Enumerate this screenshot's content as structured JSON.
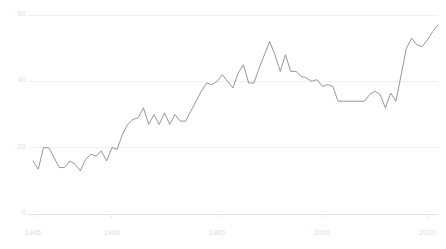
{
  "chart_data": {
    "type": "line",
    "title": "",
    "subtitle": "",
    "xlabel": "",
    "ylabel": "",
    "grid": true,
    "legend": false,
    "legend_position": "none",
    "xlim": [
      1945,
      2022
    ],
    "ylim": [
      0,
      60
    ],
    "x_ticks": [
      1945,
      1960,
      1980,
      2000,
      2020
    ],
    "x_tick_labels": [
      "1945",
      "1960",
      "1980",
      "2000",
      "2020"
    ],
    "y_ticks": [
      0,
      20,
      40,
      60
    ],
    "y_tick_labels": [
      "0",
      "20",
      "40",
      "60"
    ],
    "series": [
      {
        "name": "series-1",
        "color": "#8a8a8a",
        "x": [
          1945,
          1946,
          1947,
          1948,
          1949,
          1950,
          1951,
          1952,
          1953,
          1954,
          1955,
          1956,
          1957,
          1958,
          1959,
          1960,
          1961,
          1962,
          1963,
          1964,
          1965,
          1966,
          1967,
          1968,
          1969,
          1970,
          1971,
          1972,
          1973,
          1974,
          1975,
          1976,
          1977,
          1978,
          1979,
          1980,
          1981,
          1982,
          1983,
          1984,
          1985,
          1986,
          1987,
          1988,
          1989,
          1990,
          1991,
          1992,
          1993,
          1994,
          1995,
          1996,
          1997,
          1998,
          1999,
          2000,
          2001,
          2002,
          2003,
          2004,
          2005,
          2006,
          2007,
          2008,
          2009,
          2010,
          2011,
          2012,
          2013,
          2014,
          2015,
          2016,
          2017,
          2018,
          2019,
          2020,
          2021,
          2022
        ],
        "values": [
          16.0,
          13.5,
          20.0,
          20.0,
          17.0,
          14.0,
          14.0,
          16.0,
          15.0,
          13.0,
          16.5,
          18.0,
          17.5,
          19.0,
          16.0,
          20.0,
          19.5,
          24.0,
          27.0,
          28.5,
          29.0,
          32.0,
          27.0,
          30.0,
          27.0,
          30.5,
          27.0,
          30.0,
          28.0,
          28.0,
          31.0,
          34.0,
          37.0,
          39.5,
          39.0,
          40.0,
          42.0,
          40.0,
          38.0,
          42.5,
          45.0,
          39.5,
          39.5,
          44.0,
          48.0,
          52.0,
          48.0,
          43.0,
          48.0,
          43.0,
          43.0,
          41.5,
          41.0,
          40.0,
          40.5,
          38.5,
          39.0,
          38.5,
          34.0,
          34.0,
          34.0,
          34.0,
          34.0,
          34.0,
          36.0,
          37.0,
          36.0,
          32.0,
          36.5,
          34.0,
          42.0,
          50.0,
          53.0,
          51.0,
          50.5,
          52.5,
          55.0,
          57.0
        ]
      }
    ]
  }
}
